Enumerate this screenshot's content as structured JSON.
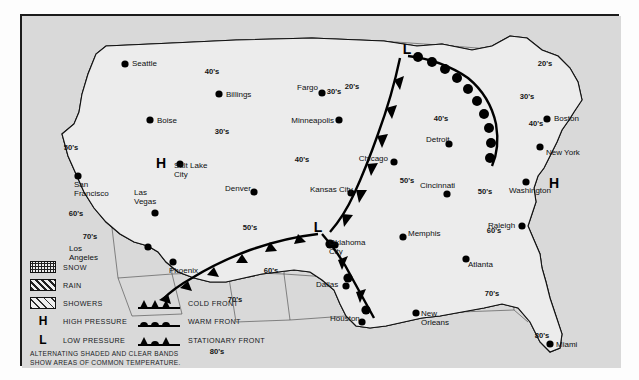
{
  "map": {
    "title": "United States Weather Map",
    "panel": {
      "bg": "#d9d9d9",
      "border": "#1c1c1c"
    },
    "band_shade": "#8d8d8d",
    "band_clear": "#ececec",
    "ink": "#0d0f10"
  },
  "legend": {
    "items": [
      {
        "key": "snow",
        "label": "SNOW",
        "swatch": "dots"
      },
      {
        "key": "rain",
        "label": "RAIN",
        "swatch": "dense-diagonal"
      },
      {
        "key": "showers",
        "label": "SHOWERS",
        "swatch": "sparse-diagonal"
      },
      {
        "key": "high",
        "label": "HIGH PRESSURE",
        "swatch": "H"
      },
      {
        "key": "low",
        "label": "LOW PRESSURE",
        "swatch": "L"
      }
    ],
    "fronts": [
      {
        "key": "cold",
        "label": "COLD FRONT",
        "symbol": "triangles"
      },
      {
        "key": "warm",
        "label": "WARM FRONT",
        "symbol": "semicircles"
      },
      {
        "key": "stationary",
        "label": "STATIONARY FRONT",
        "symbol": "alternating"
      }
    ],
    "note_line1": "ALTERNATING SHADED AND CLEAR BANDS",
    "note_line2": "SHOW AREAS OF COMMON TEMPERATURE."
  },
  "chart_data": {
    "type": "map",
    "legend_position": "bottom-left",
    "cities": [
      {
        "name": "Seattle",
        "x": 103,
        "y": 48,
        "lx": 110,
        "ly": 50,
        "anchor": "start"
      },
      {
        "name": "Boise",
        "x": 128,
        "y": 104,
        "lx": 135,
        "ly": 107,
        "anchor": "start"
      },
      {
        "name": "Billings",
        "x": 197,
        "y": 78,
        "lx": 204,
        "ly": 81,
        "anchor": "start"
      },
      {
        "name": "Fargo",
        "x": 300,
        "y": 77,
        "lx": 296,
        "ly": 74,
        "anchor": "end"
      },
      {
        "name": "Minneapolis",
        "x": 317,
        "y": 104,
        "lx": 312,
        "ly": 107,
        "anchor": "end"
      },
      {
        "name": "San Francisco",
        "x": 56,
        "y": 160,
        "lx": 52,
        "ly": 171,
        "anchor": "start"
      },
      {
        "name": "Las Vegas",
        "x": 133,
        "y": 197,
        "lx": 112,
        "ly": 179,
        "anchor": "start"
      },
      {
        "name": "Salt Lake City",
        "x": 158,
        "y": 148,
        "lx": 152,
        "ly": 152,
        "anchor": "start"
      },
      {
        "name": "Denver",
        "x": 232,
        "y": 176,
        "lx": 203,
        "ly": 175,
        "anchor": "start"
      },
      {
        "name": "Kansas City",
        "x": 329,
        "y": 177,
        "lx": 288,
        "ly": 176,
        "anchor": "start"
      },
      {
        "name": "Chicago",
        "x": 372,
        "y": 146,
        "lx": 366,
        "ly": 145,
        "anchor": "end"
      },
      {
        "name": "Detroit",
        "x": 427,
        "y": 128,
        "lx": 404,
        "ly": 126,
        "anchor": "start"
      },
      {
        "name": "Cincinnati",
        "x": 425,
        "y": 178,
        "lx": 398,
        "ly": 172,
        "anchor": "start"
      },
      {
        "name": "Boston",
        "x": 525,
        "y": 103,
        "lx": 532,
        "ly": 105,
        "anchor": "start"
      },
      {
        "name": "New York",
        "x": 518,
        "y": 131,
        "lx": 524,
        "ly": 139,
        "anchor": "start"
      },
      {
        "name": "Washington",
        "x": 504,
        "y": 166,
        "lx": 487,
        "ly": 177,
        "anchor": "start"
      },
      {
        "name": "Raleigh",
        "x": 500,
        "y": 210,
        "lx": 466,
        "ly": 212,
        "anchor": "start"
      },
      {
        "name": "Memphis",
        "x": 381,
        "y": 221,
        "lx": 386,
        "ly": 220,
        "anchor": "start"
      },
      {
        "name": "Atlanta",
        "x": 444,
        "y": 243,
        "lx": 446,
        "ly": 251,
        "anchor": "start"
      },
      {
        "name": "Oklahoma City",
        "x": 313,
        "y": 229,
        "lx": 307,
        "ly": 229,
        "anchor": "start"
      },
      {
        "name": "Dallas",
        "x": 324,
        "y": 270,
        "lx": 294,
        "ly": 271,
        "anchor": "start"
      },
      {
        "name": "Houston",
        "x": 340,
        "y": 306,
        "lx": 308,
        "ly": 305,
        "anchor": "start"
      },
      {
        "name": "New Orleans",
        "x": 394,
        "y": 297,
        "lx": 399,
        "ly": 300,
        "anchor": "start"
      },
      {
        "name": "Phoenix",
        "x": 151,
        "y": 246,
        "lx": 147,
        "ly": 257,
        "anchor": "start"
      },
      {
        "name": "Los Angeles",
        "x": 126,
        "y": 231,
        "lx": 47,
        "ly": 235,
        "anchor": "start"
      },
      {
        "name": "Miami",
        "x": 528,
        "y": 328,
        "lx": 534,
        "ly": 331,
        "anchor": "start"
      }
    ],
    "temperature_bands": [
      {
        "label": "40's",
        "x": 190,
        "y": 58
      },
      {
        "label": "30's",
        "x": 312,
        "y": 78
      },
      {
        "label": "20's",
        "x": 330,
        "y": 73
      },
      {
        "label": "30's",
        "x": 505,
        "y": 83
      },
      {
        "label": "20's",
        "x": 523,
        "y": 50
      },
      {
        "label": "40's",
        "x": 514,
        "y": 110
      },
      {
        "label": "40's",
        "x": 419,
        "y": 105
      },
      {
        "label": "30's",
        "x": 200,
        "y": 118
      },
      {
        "label": "50's",
        "x": 49,
        "y": 134
      },
      {
        "label": "40's",
        "x": 280,
        "y": 146
      },
      {
        "label": "50's",
        "x": 385,
        "y": 167
      },
      {
        "label": "50's",
        "x": 463,
        "y": 178
      },
      {
        "label": "60's",
        "x": 54,
        "y": 200
      },
      {
        "label": "50's",
        "x": 228,
        "y": 214
      },
      {
        "label": "70's",
        "x": 68,
        "y": 223
      },
      {
        "label": "60's",
        "x": 472,
        "y": 217
      },
      {
        "label": "60's",
        "x": 249,
        "y": 257
      },
      {
        "label": "70's",
        "x": 213,
        "y": 286
      },
      {
        "label": "70's",
        "x": 470,
        "y": 280
      },
      {
        "label": "80's",
        "x": 195,
        "y": 338
      },
      {
        "label": "80's",
        "x": 520,
        "y": 322
      }
    ],
    "pressure_centers": [
      {
        "type": "H",
        "x": 139,
        "y": 152
      },
      {
        "type": "L",
        "x": 385,
        "y": 38
      },
      {
        "type": "L",
        "x": 296,
        "y": 216
      },
      {
        "type": "H",
        "x": 532,
        "y": 172
      }
    ],
    "precipitation": [
      {
        "type": "rain",
        "region": "Pacific Northwest"
      },
      {
        "type": "snow",
        "region": "Idaho / Northern Rockies"
      },
      {
        "type": "snow",
        "region": "North Dakota / Fargo"
      },
      {
        "type": "showers",
        "region": "Upper Midwest / Wisconsin"
      },
      {
        "type": "rain",
        "region": "Michigan / Great Lakes"
      },
      {
        "type": "snow",
        "region": "Northern New England"
      },
      {
        "type": "showers",
        "region": "Colorado / Great Plains"
      },
      {
        "type": "snow",
        "region": "Western Kansas"
      },
      {
        "type": "showers",
        "region": "East Texas / Louisiana"
      },
      {
        "type": "showers",
        "region": "Gulf Coast / Mississippi"
      },
      {
        "type": "showers",
        "region": "Southern Florida"
      }
    ],
    "fronts": [
      {
        "type": "warm",
        "from": "L (Great Lakes)",
        "to": "Eastern Ontario"
      },
      {
        "type": "cold",
        "from": "L (Great Lakes)",
        "to": "Central Plains"
      },
      {
        "type": "cold",
        "from": "L (Oklahoma)",
        "to": "West Texas"
      },
      {
        "type": "stationary",
        "from": "Oklahoma",
        "to": "Gulf Coast"
      }
    ]
  }
}
